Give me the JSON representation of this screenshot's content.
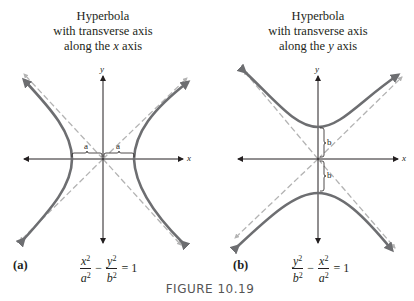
{
  "figure": {
    "title": "FIGURE 10.19",
    "colors": {
      "curve": "#6d6e71",
      "asymptote": "#b3b3b3",
      "axis": "#231f20",
      "text": "#231f20"
    }
  },
  "panels": [
    {
      "id": "a",
      "label": "(a)",
      "caption_lines": [
        "Hyperbola",
        "with transverse axis",
        "along the"
      ],
      "caption_var": "x",
      "caption_tail": "axis",
      "axis_labels": {
        "x": "x",
        "y": "y"
      },
      "brace_labels": [
        "a",
        "a"
      ],
      "equation": {
        "t1_num": "x",
        "t1_den": "a",
        "t2_num": "y",
        "t2_den": "b",
        "exp": "2",
        "minus": "−",
        "rhs": "= 1"
      }
    },
    {
      "id": "b",
      "label": "(b)",
      "caption_lines": [
        "Hyperbola",
        "with transverse axis",
        "along the"
      ],
      "caption_var": "y",
      "caption_tail": "axis",
      "axis_labels": {
        "x": "x",
        "y": "y"
      },
      "brace_labels": [
        "b",
        "b"
      ],
      "equation": {
        "t1_num": "y",
        "t1_den": "b",
        "t2_num": "x",
        "t2_den": "a",
        "exp": "2",
        "minus": "−",
        "rhs": "= 1"
      }
    }
  ]
}
